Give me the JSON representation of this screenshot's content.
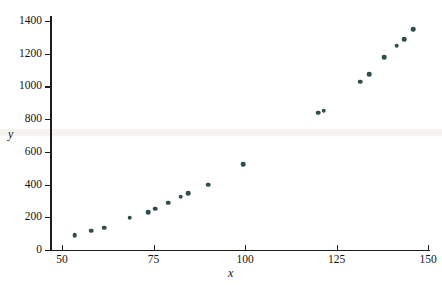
{
  "chart_data": {
    "type": "scatter",
    "title": "",
    "xlabel": "x",
    "ylabel": "y",
    "xlim": [
      50,
      150
    ],
    "ylim": [
      0,
      1400
    ],
    "xticks": [
      50,
      75,
      100,
      125,
      150
    ],
    "yticks": [
      0,
      200,
      400,
      600,
      800,
      1000,
      1200,
      1400
    ],
    "grid": false,
    "legend": null,
    "marker_color": "#2f4f4f",
    "axis_color": "#1d1d1d",
    "points": [
      {
        "x": 53.5,
        "y": 90
      },
      {
        "x": 58.0,
        "y": 118
      },
      {
        "x": 61.5,
        "y": 137
      },
      {
        "x": 68.5,
        "y": 196
      },
      {
        "x": 73.5,
        "y": 232
      },
      {
        "x": 75.5,
        "y": 254
      },
      {
        "x": 79.0,
        "y": 288
      },
      {
        "x": 82.5,
        "y": 326
      },
      {
        "x": 84.5,
        "y": 348
      },
      {
        "x": 90.0,
        "y": 400
      },
      {
        "x": 99.5,
        "y": 525
      },
      {
        "x": 120.0,
        "y": 838
      },
      {
        "x": 121.5,
        "y": 852
      },
      {
        "x": 131.5,
        "y": 1030
      },
      {
        "x": 134.0,
        "y": 1076
      },
      {
        "x": 138.0,
        "y": 1180
      },
      {
        "x": 141.5,
        "y": 1250
      },
      {
        "x": 143.5,
        "y": 1290
      },
      {
        "x": 146.0,
        "y": 1350
      }
    ]
  },
  "axis_names": {
    "x": "x",
    "y": "y"
  }
}
